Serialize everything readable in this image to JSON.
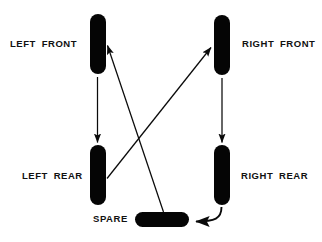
{
  "diagram": {
    "type": "tire-rotation",
    "background_color": "#ffffff",
    "ink_color": "#050505",
    "positions": [
      {
        "key": "left_front",
        "label": "LEFT FRONT",
        "shape": "tire-vertical",
        "x": 90,
        "y": 14,
        "w": 16,
        "h": 60
      },
      {
        "key": "right_front",
        "label": "RIGHT FRONT",
        "shape": "tire-vertical",
        "x": 214,
        "y": 15,
        "w": 16,
        "h": 60
      },
      {
        "key": "left_rear",
        "label": "LEFT REAR",
        "shape": "tire-vertical",
        "x": 90,
        "y": 145,
        "w": 16,
        "h": 60
      },
      {
        "key": "right_rear",
        "label": "RIGHT REAR",
        "shape": "tire-vertical",
        "x": 214,
        "y": 145,
        "w": 16,
        "h": 60
      },
      {
        "key": "spare",
        "label": "SPARE",
        "shape": "tire-horizontal",
        "x": 135,
        "y": 212,
        "w": 54,
        "h": 15
      }
    ],
    "labels": {
      "left_front": "LEFT FRONT",
      "right_front": "RIGHT FRONT",
      "left_rear": "LEFT REAR",
      "right_rear": "RIGHT REAR",
      "spare": "SPARE"
    },
    "rotation_arrows": [
      {
        "from": "left_front",
        "to": "left_rear",
        "style": "straight-vertical"
      },
      {
        "from": "right_front",
        "to": "right_rear",
        "style": "straight-vertical"
      },
      {
        "from": "left_rear",
        "to": "right_front",
        "style": "straight-diagonal"
      },
      {
        "from": "spare",
        "to": "left_front",
        "style": "straight-diagonal"
      },
      {
        "from": "right_rear",
        "to": "spare",
        "style": "curved"
      }
    ]
  }
}
